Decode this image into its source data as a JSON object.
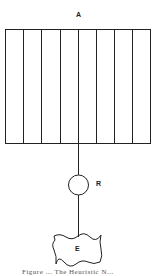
{
  "diagram": {
    "labels": {
      "top_block": "A",
      "circle_node": "R",
      "bottom_block": "E"
    },
    "top_block": {
      "columns": 8
    },
    "caption": "Figure ... The Heuristic N..."
  }
}
